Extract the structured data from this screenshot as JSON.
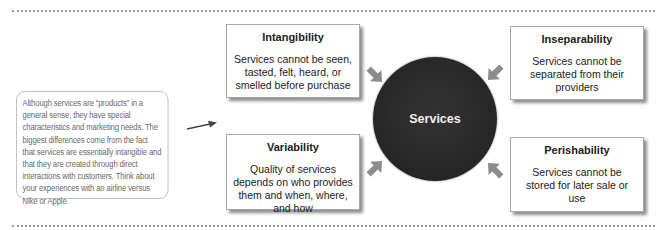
{
  "note": {
    "text": "Although services are “products” in a general sense, they have special characteristics and marketing needs. The biggest differences come from the fact that services are essentially intangible and that they are created through direct interactions with customers. Think about your experiences with an airline versus Nike or Apple."
  },
  "center": {
    "label": "Services"
  },
  "boxes": {
    "intangibility": {
      "title": "Intangibility",
      "desc": "Services cannot be seen, tasted, felt, heard, or smelled before purchase"
    },
    "inseparability": {
      "title": "Inseparability",
      "desc": "Services cannot be separated from their providers"
    },
    "variability": {
      "title": "Variability",
      "desc": "Quality of services depends on who provides them and when, where, and how"
    },
    "perishability": {
      "title": "Perishability",
      "desc": "Services cannot be stored for later sale or use"
    }
  },
  "colors": {
    "circle": "#262626",
    "arrow": "#8c8c8c",
    "note_text": "#6a6a6a",
    "dotline": "#9a9a9a"
  }
}
